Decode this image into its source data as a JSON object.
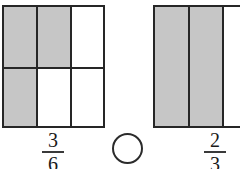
{
  "page": {
    "background_color": "#ffffff"
  },
  "style": {
    "shaded_color": "#c6c6c6",
    "unshaded_color": "#ffffff",
    "line_color": "#262626",
    "text_color": "#1a1a1a"
  },
  "comparison": {
    "operator": "",
    "operator_placeholder": "",
    "shape": "circle",
    "note": "empty answer circle between the two models"
  },
  "models": [
    {
      "id": "left",
      "name": "three-sixths-model",
      "columns": 3,
      "rows": 2,
      "total_parts": 6,
      "shaded_parts": 3,
      "cells": [
        {
          "row": 1,
          "col": 1,
          "shaded": true
        },
        {
          "row": 1,
          "col": 2,
          "shaded": true
        },
        {
          "row": 1,
          "col": 3,
          "shaded": false
        },
        {
          "row": 2,
          "col": 1,
          "shaded": true
        },
        {
          "row": 2,
          "col": 2,
          "shaded": false
        },
        {
          "row": 2,
          "col": 3,
          "shaded": false
        }
      ],
      "fraction": {
        "numerator": "3",
        "denominator": "6"
      }
    },
    {
      "id": "right",
      "name": "two-thirds-model",
      "columns": 3,
      "rows": 1,
      "total_parts": 3,
      "shaded_parts": 2,
      "clipped_at_page_edge": true,
      "cells": [
        {
          "row": 1,
          "col": 1,
          "shaded": true
        },
        {
          "row": 1,
          "col": 2,
          "shaded": true
        },
        {
          "row": 1,
          "col": 3,
          "shaded": false
        }
      ],
      "fraction": {
        "numerator": "2",
        "denominator": "3"
      }
    }
  ]
}
